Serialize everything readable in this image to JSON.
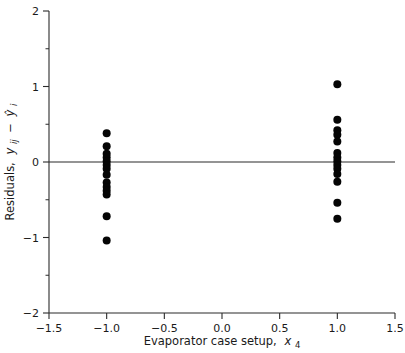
{
  "chart_data": {
    "type": "scatter",
    "title": "",
    "xlabel": "Evaporator case setup, x4",
    "xlabel_main": "Evaporator case setup,",
    "xlabel_var": "x",
    "xlabel_sub": "4",
    "ylabel": "Residuals, yij - ŷi",
    "ylabel_main": "Residuals,",
    "ylabel_var": "y",
    "ylabel_sub": "ij",
    "ylabel_minus": "−",
    "ylabel_var2": "ŷ",
    "ylabel_sub2": "i",
    "xlim": [
      -1.5,
      1.5
    ],
    "ylim": [
      -2,
      2
    ],
    "xticks": [
      -1.5,
      -1.0,
      -0.5,
      0.0,
      0.5,
      1.0,
      1.5
    ],
    "xticklabels": [
      "-1.5",
      "-1.0",
      "-0.5",
      "0.0",
      "0.5",
      "1.0",
      "1.5"
    ],
    "yticks": [
      -2,
      -1,
      0,
      1,
      2
    ],
    "yticklabels": [
      "-2",
      "-1",
      "0",
      "1",
      "2"
    ],
    "yminorticks": [
      -1.5,
      -0.5,
      0.5,
      1.5
    ],
    "grid": false,
    "legend": null,
    "reference_line_y": 0,
    "marker": "filled-circle",
    "marker_color": "#050505",
    "marker_size_px": 5.2,
    "series": [
      {
        "name": "residuals at x4 = -1",
        "x": [
          -1.0,
          -1.0,
          -1.0,
          -1.0,
          -1.0,
          -1.0,
          -1.0,
          -1.0,
          -1.0,
          -1.0,
          -1.0,
          -1.0,
          -1.0,
          -1.0
        ],
        "values": [
          0.38,
          0.21,
          0.06,
          0.01,
          -0.04,
          -0.09,
          -0.17,
          -0.27,
          -0.33,
          -0.38,
          -0.43,
          -0.72,
          -1.04,
          0.11
        ]
      },
      {
        "name": "residuals at x4 = 1",
        "x": [
          1.0,
          1.0,
          1.0,
          1.0,
          1.0,
          1.0,
          1.0,
          1.0,
          1.0,
          1.0,
          1.0,
          1.0,
          1.0,
          1.0
        ],
        "values": [
          1.03,
          0.56,
          0.42,
          0.36,
          0.27,
          0.12,
          0.06,
          0.01,
          -0.04,
          -0.09,
          -0.16,
          -0.26,
          -0.54,
          -0.75
        ]
      }
    ]
  },
  "axes_geometry": {
    "plot_left_px": 49,
    "plot_right_px": 395,
    "plot_top_px": 11,
    "plot_bottom_px": 313
  }
}
